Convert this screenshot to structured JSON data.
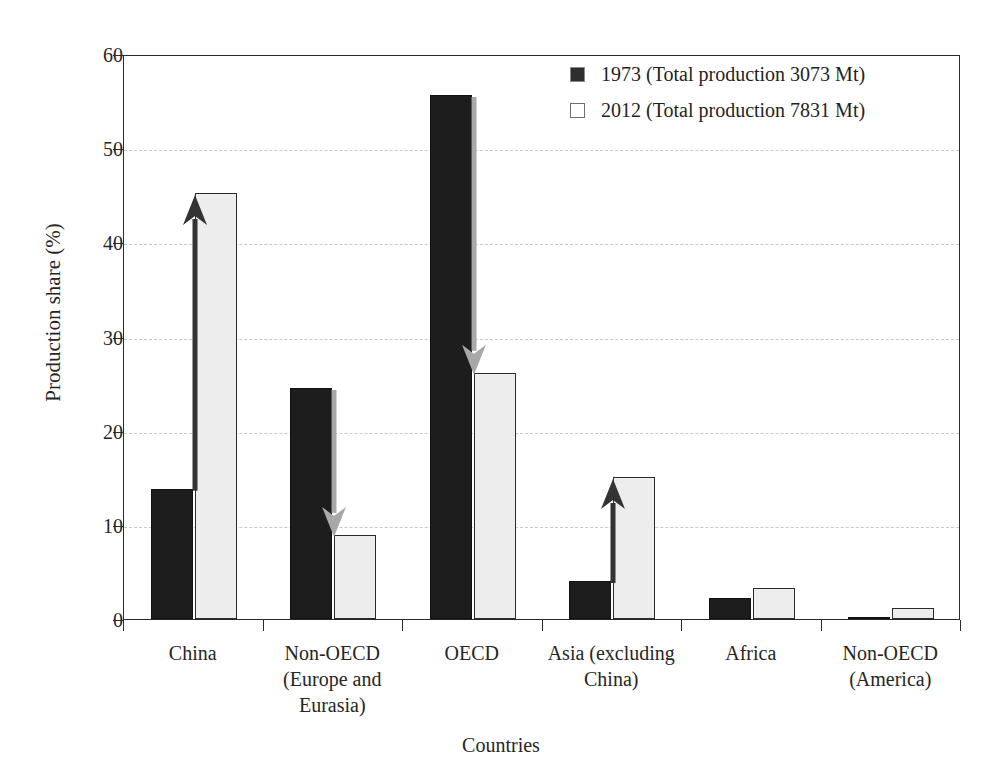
{
  "chart_data": {
    "type": "bar",
    "title": "",
    "xlabel": "Countries",
    "ylabel": "Production share (%)",
    "ylim": [
      0,
      60
    ],
    "yticks": [
      0,
      10,
      20,
      30,
      40,
      50,
      60
    ],
    "grid": "horizontal-dashed",
    "legend_position": "top-right",
    "categories": [
      "China",
      "Non-OECD\n(Europe and\nEurasia)",
      "OECD",
      "Asia (excluding\nChina)",
      "Africa",
      "Non-OECD\n(America)"
    ],
    "category_lines": [
      [
        "China"
      ],
      [
        "Non-OECD",
        "(Europe and",
        "Eurasia)"
      ],
      [
        "OECD"
      ],
      [
        "Asia (excluding",
        "China)"
      ],
      [
        "Africa"
      ],
      [
        "Non-OECD",
        "(America)"
      ]
    ],
    "series": [
      {
        "name": "1973 (Total production 3073 Mt)",
        "short_name": "1973",
        "color": "#1d1d1d",
        "values": [
          13.8,
          24.5,
          55.6,
          4.0,
          2.2,
          0.2
        ]
      },
      {
        "name": "2012 (Total production 7831 Mt)",
        "short_name": "2012",
        "color": "#ededed",
        "values": [
          45.2,
          8.9,
          26.1,
          15.1,
          3.3,
          1.2
        ]
      }
    ],
    "annotations": [
      {
        "label": "china-increase-arrow",
        "category": "China",
        "direction": "up",
        "color": "#333333",
        "from": 13.8,
        "to": 45.2
      },
      {
        "label": "non-oecd-europe-decrease-arrow",
        "category": "Non-OECD (Europe and Eurasia)",
        "direction": "down",
        "color": "#a8a8a8",
        "from": 24.5,
        "to": 8.9
      },
      {
        "label": "oecd-decrease-arrow",
        "category": "OECD",
        "direction": "down",
        "color": "#a8a8a8",
        "from": 55.6,
        "to": 26.1
      },
      {
        "label": "asia-increase-arrow",
        "category": "Asia (excluding China)",
        "direction": "up",
        "color": "#333333",
        "from": 4.0,
        "to": 15.1
      }
    ]
  },
  "axes": {
    "y_title": "Production share (%)",
    "x_title": "Countries",
    "y_tick_labels": [
      "0",
      "10",
      "20",
      "30",
      "40",
      "50",
      "60"
    ]
  },
  "legend": {
    "entries": [
      {
        "swatch": "filled-dark-square",
        "label": "1973 (Total production 3073 Mt)"
      },
      {
        "swatch": "outlined-light-square",
        "label": "2012 (Total production 7831 Mt)"
      }
    ]
  }
}
